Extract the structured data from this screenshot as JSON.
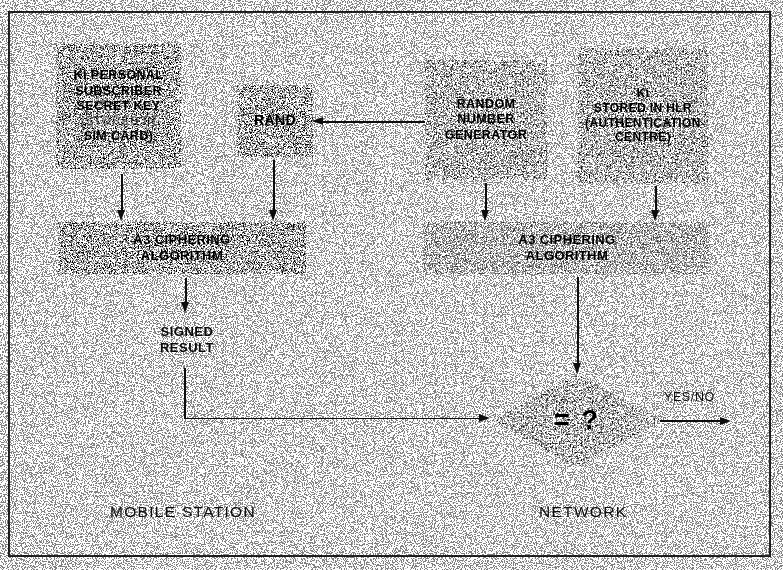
{
  "diagram": {
    "nodes": {
      "ki_sim": {
        "label": "Ki PERSONAL\nSUBSCRIBER\nSECRET KEY\n(STORED IN\nSIM CARD)",
        "lines": [
          "Ki PERSONAL",
          "SUBSCRIBER",
          "SECRET KEY",
          "(STORED IN",
          "SIM CARD)"
        ],
        "texture": "light"
      },
      "rand": {
        "label": "RAND",
        "lines": [
          "RAND"
        ],
        "texture": "light"
      },
      "rng": {
        "label": "RANDOM\nNUMBER\nGENERATOR",
        "lines": [
          "RANDOM",
          "NUMBER",
          "GENERATOR"
        ],
        "texture": "heavy"
      },
      "ki_hlr": {
        "label": "Ki\nSTORED IN HLR\n(AUTHENTICATION\nCENTRE)",
        "lines": [
          "Ki",
          "STORED IN HLR",
          "(AUTHENTICATION",
          "CENTRE)"
        ],
        "texture": "heavy"
      },
      "a3_mobile": {
        "label": "A3 CIPHERING\nALGORITHM",
        "lines": [
          "A3 CIPHERING",
          "ALGORITHM"
        ],
        "texture": "light"
      },
      "a3_network": {
        "label": "A3 CIPHERING\nALGORITHM",
        "lines": [
          "A3 CIPHERING",
          "ALGORITHM"
        ],
        "texture": "medium"
      },
      "signed_result": {
        "label": "SIGNED\nRESULT",
        "lines": [
          "SIGNED",
          "RESULT"
        ],
        "texture": "none"
      },
      "compare": {
        "label": "= ?",
        "texture": "heavy"
      }
    },
    "edge_labels": {
      "yes_no": "YES/NO"
    },
    "zones": {
      "left": "MOBILE STATION",
      "right": "NETWORK"
    },
    "colors": {
      "ink": "#111111",
      "paper": "#ffffff",
      "frame": "#2c2c2c"
    }
  }
}
